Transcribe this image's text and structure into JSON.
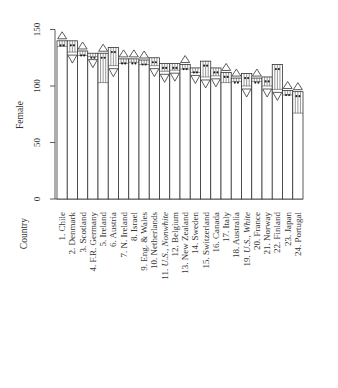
{
  "chart_data": {
    "type": "bar",
    "orientation": "rotated-90",
    "title": "",
    "ylabel": "Female",
    "xlabel": "Country",
    "ylim": [
      0,
      150
    ],
    "yticks": [
      0,
      50,
      100,
      150
    ],
    "grid": false,
    "legend": null,
    "categories": [
      "1. Chile",
      "2. Denmark",
      "3. Scotland",
      "4. F.R. Germany",
      "5. Ireland",
      "6. Austria",
      "7. N. Ireland",
      "8. Israel",
      "9. Eng. & Wales",
      "10. Netherlands",
      "11. U.S., Nonwhite",
      "12. Belgium",
      "13. New Zealand",
      "14. Sweden",
      "15. Switzerland",
      "16. Canada",
      "17. Italy",
      "18. Australia",
      "19. U.S., White",
      "20. France",
      "21. Norway",
      "22. Finland",
      "23. Japan",
      "24. Portugal"
    ],
    "italic_categories": [
      "U.S., Nonwhite",
      "U.S., White"
    ],
    "series": [
      {
        "name": "bar_top",
        "values": [
          140,
          140,
          131,
          129,
          129,
          134,
          124,
          124,
          123,
          125,
          120,
          120,
          119,
          116,
          122,
          116,
          112,
          107,
          111,
          107,
          108,
          119,
          96,
          95
        ]
      },
      {
        "name": "range_low",
        "values": [
          135,
          130,
          127,
          126,
          103,
          118,
          120,
          121,
          119,
          118,
          113,
          114,
          115,
          112,
          108,
          109,
          103,
          104,
          100,
          104,
          100,
          97,
          92,
          76
        ]
      },
      {
        "name": "marker_direction",
        "values": [
          "up",
          "down",
          "up",
          "down",
          "up",
          "down",
          "up",
          "up",
          "up",
          "down",
          "down",
          "down",
          "up",
          "down",
          "down",
          "down",
          "up",
          "up",
          "down",
          "up",
          "down",
          "down",
          "up",
          "up"
        ]
      }
    ]
  },
  "axis": {
    "y_title": "Female",
    "x_title": "Country",
    "ticks": [
      "0",
      "50",
      "100",
      "150"
    ]
  }
}
